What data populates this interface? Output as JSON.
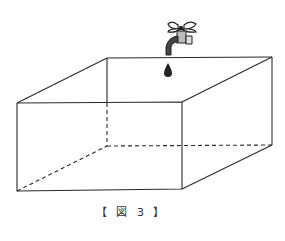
{
  "figure": {
    "caption": "【 図 3 】",
    "colors": {
      "line": "#2a2a2a",
      "background": "#ffffff"
    },
    "box": {
      "front_top_left": [
        17,
        103
      ],
      "front_top_right": [
        182,
        102
      ],
      "front_bottom_left": [
        17,
        191
      ],
      "front_bottom_right": [
        182,
        189
      ],
      "back_top_left": [
        107,
        58
      ],
      "back_top_right": [
        272,
        57
      ],
      "back_bottom_left": [
        107,
        146
      ],
      "back_bottom_right": [
        272,
        145
      ]
    },
    "icons": [
      "faucet-icon",
      "water-drop-icon"
    ]
  }
}
